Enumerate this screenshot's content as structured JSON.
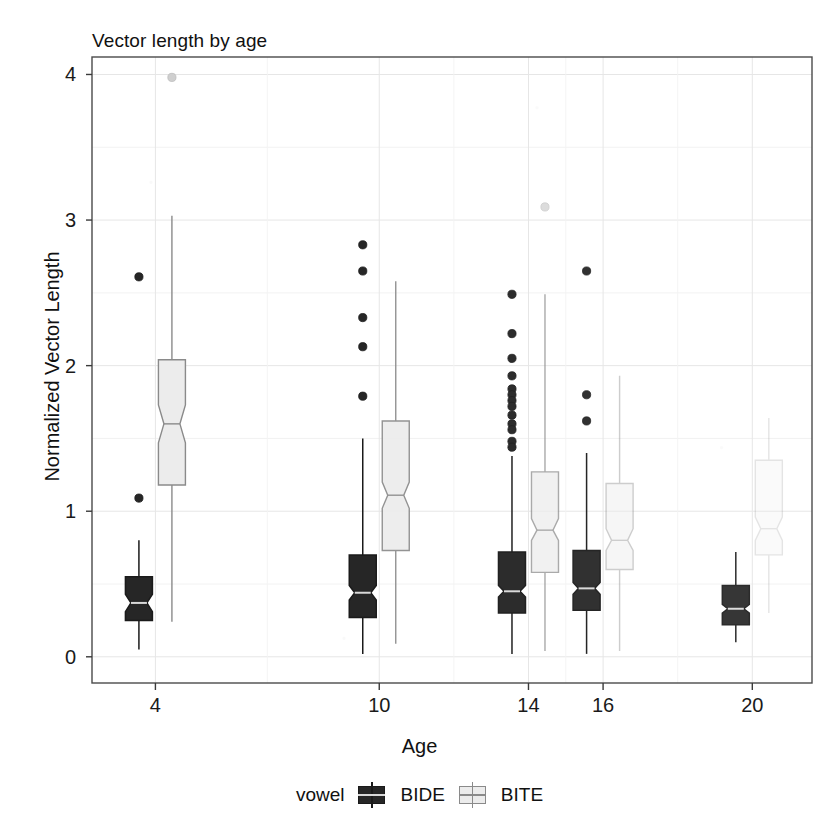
{
  "chart_data": {
    "type": "box",
    "title": "Vector length by age",
    "xlabel": "Age",
    "ylabel": "Normalized Vector Length",
    "xlim": [
      2.3,
      21.6
    ],
    "ylim": [
      -0.18,
      4.12
    ],
    "yticks": [
      0,
      1,
      2,
      3,
      4
    ],
    "ytick_labels": [
      "0",
      "1",
      "2",
      "3",
      "4"
    ],
    "xticks": [
      4,
      10,
      14,
      16,
      20
    ],
    "xtick_labels": [
      "4",
      "10",
      "14",
      "16",
      "20"
    ],
    "grid": "light-gray-major-and-minor",
    "notched": true,
    "dodge": true,
    "legend": {
      "title": "vowel",
      "position": "bottom",
      "entries": [
        {
          "label": "BIDE",
          "fill": "#262626",
          "line": "#1a1a1a"
        },
        {
          "label": "BITE",
          "fill": "#ececec",
          "line": "#8a8a8a"
        }
      ]
    },
    "categories": [
      "4",
      "10",
      "14",
      "16",
      "20"
    ],
    "series": [
      {
        "name": "BIDE",
        "fill": "#262626",
        "line": "#1a1a1a",
        "boxes": [
          {
            "category": "4",
            "lower_whisker": 0.05,
            "q1": 0.25,
            "median": 0.37,
            "q3": 0.55,
            "upper_whisker": 0.8,
            "notch_lower": 0.31,
            "notch_upper": 0.43,
            "outliers": [
              2.61,
              1.09
            ]
          },
          {
            "category": "10",
            "lower_whisker": 0.02,
            "q1": 0.27,
            "median": 0.44,
            "q3": 0.7,
            "upper_whisker": 1.5,
            "notch_lower": 0.39,
            "notch_upper": 0.49,
            "outliers": [
              2.83,
              2.65,
              2.33,
              2.13,
              1.79
            ]
          },
          {
            "category": "14",
            "lower_whisker": 0.02,
            "q1": 0.3,
            "median": 0.45,
            "q3": 0.72,
            "upper_whisker": 1.38,
            "notch_lower": 0.41,
            "notch_upper": 0.49,
            "outliers": [
              2.49,
              2.22,
              2.05,
              1.93,
              1.84,
              1.8,
              1.76,
              1.72,
              1.66,
              1.6,
              1.56,
              1.48,
              1.44
            ]
          },
          {
            "category": "16",
            "lower_whisker": 0.02,
            "q1": 0.32,
            "median": 0.47,
            "q3": 0.73,
            "upper_whisker": 1.4,
            "notch_lower": 0.43,
            "notch_upper": 0.51,
            "outliers": [
              2.65,
              1.8,
              1.62
            ]
          },
          {
            "category": "20",
            "lower_whisker": 0.1,
            "q1": 0.22,
            "median": 0.33,
            "q3": 0.49,
            "upper_whisker": 0.72,
            "notch_lower": 0.3,
            "notch_upper": 0.36,
            "outliers": []
          }
        ]
      },
      {
        "name": "BITE",
        "fill": "#ececec",
        "line": "#8a8a8a",
        "boxes": [
          {
            "category": "4",
            "lower_whisker": 0.24,
            "q1": 1.18,
            "median": 1.6,
            "q3": 2.04,
            "upper_whisker": 3.03,
            "notch_lower": 1.47,
            "notch_upper": 1.73,
            "outliers": [
              3.98
            ]
          },
          {
            "category": "10",
            "lower_whisker": 0.09,
            "q1": 0.73,
            "median": 1.11,
            "q3": 1.62,
            "upper_whisker": 2.58,
            "notch_lower": 1.02,
            "notch_upper": 1.2,
            "outliers": []
          },
          {
            "category": "14",
            "lower_whisker": 0.04,
            "q1": 0.58,
            "median": 0.87,
            "q3": 1.27,
            "upper_whisker": 2.49,
            "notch_lower": 0.8,
            "notch_upper": 0.95,
            "outliers": [
              3.09
            ]
          },
          {
            "category": "16",
            "lower_whisker": 0.04,
            "q1": 0.6,
            "median": 0.8,
            "q3": 1.19,
            "upper_whisker": 1.93,
            "notch_lower": 0.73,
            "notch_upper": 0.88,
            "outliers": []
          },
          {
            "category": "20",
            "lower_whisker": 0.3,
            "q1": 0.7,
            "median": 0.88,
            "q3": 1.35,
            "upper_whisker": 1.64,
            "notch_lower": 0.8,
            "notch_upper": 0.96,
            "outliers": []
          }
        ]
      }
    ]
  }
}
